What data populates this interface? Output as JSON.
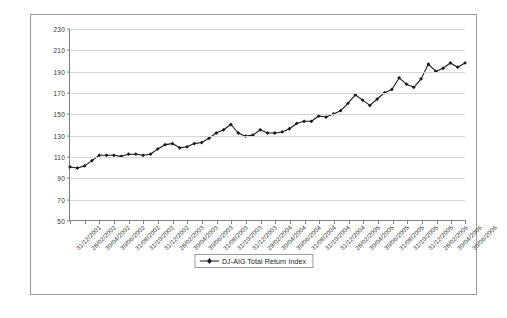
{
  "chart_data": {
    "type": "line",
    "title": "",
    "xlabel": "",
    "ylabel": "",
    "ylim": [
      50,
      230
    ],
    "ytick_step": 20,
    "yticks": [
      50,
      70,
      90,
      110,
      130,
      150,
      170,
      190,
      210,
      230
    ],
    "grid": true,
    "legend_position": "bottom-center",
    "marker": "diamond",
    "line_color": "#1a1a1a",
    "x_tick_interval_months": 2,
    "series": [
      {
        "name": "DJ-AIG Total Return Index",
        "x": [
          "31/12/2001",
          "31/01/2002",
          "28/02/2002",
          "31/03/2002",
          "30/04/2002",
          "31/05/2002",
          "30/06/2002",
          "31/07/2002",
          "31/08/2002",
          "30/09/2002",
          "31/10/2002",
          "30/11/2002",
          "31/12/2002",
          "31/01/2003",
          "28/02/2003",
          "31/03/2003",
          "30/04/2003",
          "31/05/2003",
          "30/06/2003",
          "31/07/2003",
          "31/08/2003",
          "30/09/2003",
          "31/10/2003",
          "30/11/2003",
          "31/12/2003",
          "31/01/2004",
          "29/02/2004",
          "31/03/2004",
          "30/04/2004",
          "31/05/2004",
          "30/06/2004",
          "31/07/2004",
          "31/08/2004",
          "30/09/2004",
          "31/10/2004",
          "30/11/2004",
          "31/12/2004",
          "31/01/2005",
          "28/02/2005",
          "31/03/2005",
          "30/04/2005",
          "31/05/2005",
          "30/06/2005",
          "31/07/2005",
          "31/08/2005",
          "30/09/2005",
          "31/10/2005",
          "30/11/2005",
          "31/12/2005",
          "31/01/2006",
          "28/02/2006",
          "31/03/2006",
          "30/04/2006",
          "31/05/2006",
          "30/06/2006"
        ],
        "values": [
          100,
          99,
          101,
          106,
          111,
          111,
          111,
          110,
          112,
          112,
          111,
          112,
          117,
          121,
          122,
          118,
          119,
          122,
          123,
          127,
          132,
          135,
          140,
          132,
          129,
          130,
          135,
          132,
          132,
          133,
          136,
          141,
          143,
          143,
          148,
          147,
          150,
          153,
          160,
          168,
          163,
          158,
          164,
          170,
          173,
          184,
          178,
          175,
          183,
          197,
          190,
          193,
          198,
          194,
          198
        ]
      }
    ],
    "xtick_labels": [
      "31/12/2001",
      "28/02/2002",
      "30/04/2002",
      "30/06/2002",
      "31/08/2002",
      "31/10/2002",
      "31/12/2002",
      "28/02/2003",
      "30/04/2003",
      "30/06/2003",
      "31/08/2003",
      "31/10/2003",
      "31/12/2003",
      "29/02/2004",
      "30/04/2004",
      "30/06/2004",
      "31/08/2004",
      "31/10/2004",
      "31/12/2004",
      "28/02/2005",
      "30/04/2005",
      "30/06/2005",
      "31/08/2005",
      "31/10/2005",
      "31/12/2005",
      "28/02/2006",
      "30/04/2006",
      "30/06/2006"
    ]
  },
  "legend": {
    "label": "DJ-AIG Total Return Index"
  }
}
